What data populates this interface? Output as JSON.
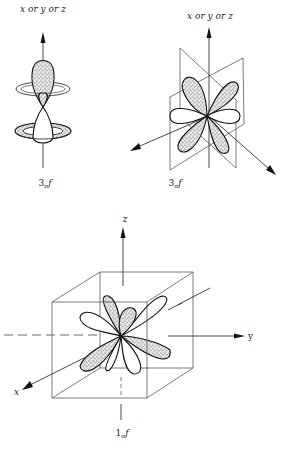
{
  "figure_top_left": {
    "axis_label": "x or y or z",
    "orbital_label_main": "3",
    "orbital_label_sub": "σ",
    "orbital_label_suffix": "f"
  },
  "figure_top_right": {
    "axis_label": "x or y or z",
    "orbital_label_main": "3",
    "orbital_label_sub": "σ",
    "orbital_label_suffix": "f"
  },
  "figure_bottom": {
    "z_label": "z",
    "y_label": "y",
    "x_label": "x",
    "orbital_label_main": "1",
    "orbital_label_sub": "σ",
    "orbital_label_suffix": "f"
  },
  "colors": {
    "line": "#333333",
    "stipple": "#7a7a7a",
    "background": "#ffffff"
  }
}
